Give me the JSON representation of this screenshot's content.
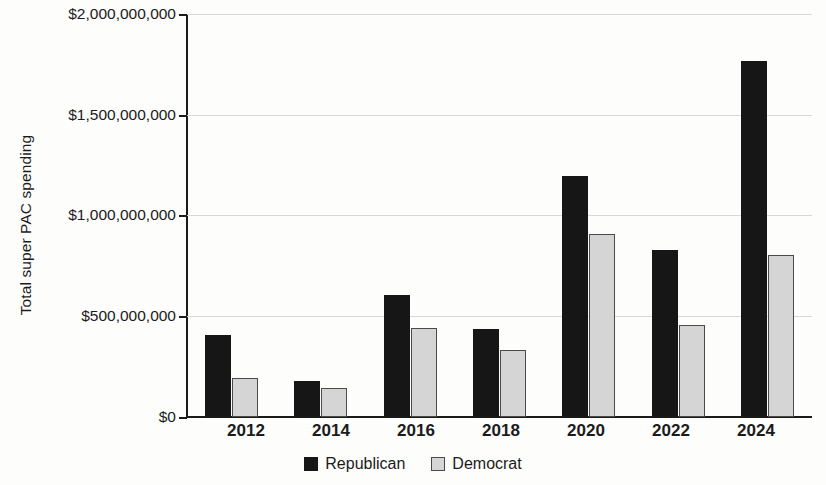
{
  "chart_data": {
    "type": "bar",
    "title": "",
    "subtitle": "",
    "xlabel": "",
    "ylabel": "Total super PAC spending",
    "categories": [
      "2012",
      "2014",
      "2016",
      "2018",
      "2020",
      "2022",
      "2024"
    ],
    "series": [
      {
        "name": "Republican",
        "color": "#161616",
        "values": [
          408000000,
          179000000,
          607000000,
          438000000,
          1194000000,
          831000000,
          1766000000
        ]
      },
      {
        "name": "Democrat",
        "color": "#d5d5d5",
        "values": [
          194000000,
          144000000,
          443000000,
          333000000,
          910000000,
          458000000,
          806000000
        ]
      }
    ],
    "ylim": [
      0,
      2000000000
    ],
    "ytick_values": [
      0,
      500000000,
      1000000000,
      1500000000,
      2000000000
    ],
    "ytick_labels": [
      "$0",
      "$500,000,000",
      "$1,000,000,000",
      "$1,500,000,000",
      "$2,000,000,000"
    ],
    "grid": true,
    "grid_axis": "y",
    "legend_position": "bottom-center",
    "legend_entries": [
      "Republican",
      "Democrat"
    ],
    "background_color": "#fdfdfc",
    "gridline_color": "#d9d9d9",
    "axis_color": "#1b1b1b"
  }
}
